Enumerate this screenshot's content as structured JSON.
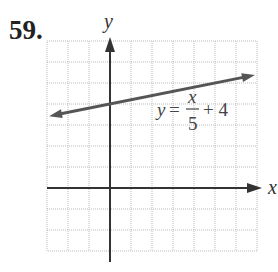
{
  "problem_number": "59.",
  "chart_data": {
    "type": "line",
    "title": "",
    "xlabel": "x",
    "ylabel": "y",
    "xlim": [
      -3,
      7
    ],
    "ylim": [
      -3,
      7
    ],
    "grid": true,
    "equation_label": "y = x/5 + 4",
    "series": [
      {
        "name": "y = x/5 + 4",
        "slope": 0.2,
        "intercept": 4,
        "x": [
          -3,
          7
        ],
        "y": [
          3.4,
          5.4
        ]
      }
    ]
  },
  "labels": {
    "x_axis": "x",
    "y_axis": "y",
    "eq_y": "y",
    "eq_eq": "=",
    "eq_num": "x",
    "eq_den": "5",
    "eq_tail": "+ 4"
  }
}
